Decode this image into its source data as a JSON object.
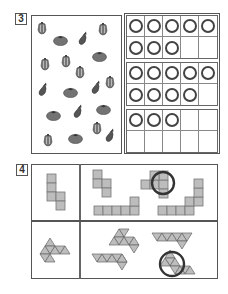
{
  "section3": {
    "number": "3",
    "vegetables": [
      {
        "type": "pepper",
        "x": 42,
        "y": 28
      },
      {
        "type": "tomato",
        "x": 60,
        "y": 40
      },
      {
        "type": "eggplant",
        "x": 83,
        "y": 38
      },
      {
        "type": "pepper",
        "x": 103,
        "y": 29
      },
      {
        "type": "tomato",
        "x": 99,
        "y": 56
      },
      {
        "type": "pepper",
        "x": 45,
        "y": 64
      },
      {
        "type": "pepper",
        "x": 66,
        "y": 61
      },
      {
        "type": "pepper",
        "x": 80,
        "y": 72
      },
      {
        "type": "eggplant",
        "x": 43,
        "y": 89
      },
      {
        "type": "tomato",
        "x": 70,
        "y": 92
      },
      {
        "type": "eggplant",
        "x": 96,
        "y": 87
      },
      {
        "type": "pepper",
        "x": 110,
        "y": 82
      },
      {
        "type": "tomato",
        "x": 53,
        "y": 115
      },
      {
        "type": "eggplant",
        "x": 78,
        "y": 111
      },
      {
        "type": "tomato",
        "x": 103,
        "y": 109
      },
      {
        "type": "pepper",
        "x": 97,
        "y": 128
      },
      {
        "type": "pepper",
        "x": 48,
        "y": 140
      },
      {
        "type": "tomato",
        "x": 75,
        "y": 138
      },
      {
        "type": "eggplant",
        "x": 110,
        "y": 135
      }
    ],
    "ten_frames": [
      {
        "filled": 8
      },
      {
        "filled": 9
      },
      {
        "filled": 3
      }
    ]
  },
  "section4": {
    "number": "4",
    "rows": [
      {
        "shape_type": "cube-net",
        "circled_option": 2,
        "option_count": 4
      },
      {
        "shape_type": "octahedron-net",
        "circled_option": 4,
        "option_count": 4
      }
    ]
  },
  "colors": {
    "border": "#555555",
    "shape_fill": "#bdbdbd",
    "shape_stroke": "#777777",
    "ring": "#444444",
    "veg_fill": "#6a6a6a"
  }
}
